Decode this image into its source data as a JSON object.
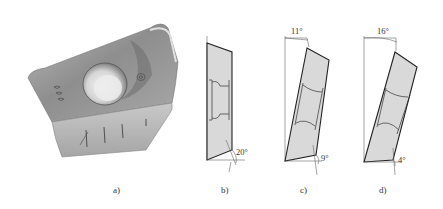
{
  "figure": {
    "panels": [
      {
        "id": "a",
        "caption": "a)",
        "content": "photo of indexable milling insert",
        "icon": "milling-insert-photo"
      },
      {
        "id": "b",
        "caption": "b)",
        "content": "insert side profile",
        "angles": {
          "clearance_bottom": "20°"
        }
      },
      {
        "id": "c",
        "caption": "c)",
        "content": "insert tilted profile",
        "angles": {
          "tilt_top": "11°",
          "clearance_bottom": "9°"
        }
      },
      {
        "id": "d",
        "caption": "d)",
        "content": "insert tilted profile",
        "angles": {
          "tilt_top": "16°",
          "clearance_bottom": "4°"
        }
      }
    ]
  },
  "colors": {
    "insert_face": "#d9d9d9",
    "outline": "#222222",
    "photo_body": "#9a9a9a",
    "photo_highlight": "#e6e6e6"
  }
}
